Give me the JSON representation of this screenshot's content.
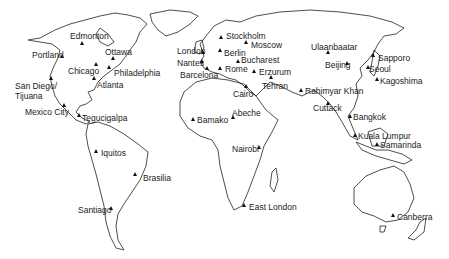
{
  "map": {
    "type": "world-outline",
    "marker_symbol": "triangle",
    "colors": {
      "land_outline": "#222222",
      "marker": "#111111",
      "label": "#222222",
      "background": "#ffffff"
    }
  },
  "cities": [
    {
      "name": "Edmonton",
      "mx": 82,
      "my": 43,
      "lx": 70,
      "ly": 32
    },
    {
      "name": "Portland",
      "mx": 62,
      "my": 56,
      "lx": 32,
      "ly": 51
    },
    {
      "name": "Ottawa",
      "mx": 113,
      "my": 58,
      "lx": 105,
      "ly": 48
    },
    {
      "name": "Chicago",
      "mx": 96,
      "my": 64,
      "lx": 68,
      "ly": 67
    },
    {
      "name": "Philadelphia",
      "mx": 109,
      "my": 67,
      "lx": 114,
      "ly": 69
    },
    {
      "name": "Atlanta",
      "mx": 94,
      "my": 78,
      "lx": 97,
      "ly": 81
    },
    {
      "name": "San Diego/",
      "mx": 51,
      "my": 78,
      "lx": 15,
      "ly": 82
    },
    {
      "name": "Tijuana",
      "mx": -100,
      "my": -100,
      "lx": 15,
      "ly": 92
    },
    {
      "name": "Mexico City",
      "mx": 64,
      "my": 105,
      "lx": 25,
      "ly": 108
    },
    {
      "name": "Tegucigalpa",
      "mx": 79,
      "my": 115,
      "lx": 82,
      "ly": 114
    },
    {
      "name": "Iquitos",
      "mx": 96,
      "my": 151,
      "lx": 101,
      "ly": 149
    },
    {
      "name": "Brasilia",
      "mx": 135,
      "my": 174,
      "lx": 143,
      "ly": 174
    },
    {
      "name": "Santiago",
      "mx": 111,
      "my": 208,
      "lx": 78,
      "ly": 206
    },
    {
      "name": "Stockholm",
      "mx": 221,
      "my": 37,
      "lx": 226,
      "ly": 32
    },
    {
      "name": "Moscow",
      "mx": 246,
      "my": 42,
      "lx": 251,
      "ly": 41
    },
    {
      "name": "London",
      "mx": 203,
      "my": 52,
      "lx": 177,
      "ly": 47
    },
    {
      "name": "Berlin",
      "mx": 220,
      "my": 50,
      "lx": 224,
      "ly": 49
    },
    {
      "name": "Nantes",
      "mx": 202,
      "my": 61,
      "lx": 177,
      "ly": 59
    },
    {
      "name": "Bucharest",
      "mx": 238,
      "my": 61,
      "lx": 241,
      "ly": 56
    },
    {
      "name": "Barcelona",
      "mx": 207,
      "my": 68,
      "lx": 180,
      "ly": 71
    },
    {
      "name": "Rome",
      "mx": 220,
      "my": 68,
      "lx": 225,
      "ly": 65
    },
    {
      "name": "Erzurum",
      "mx": 254,
      "my": 71,
      "lx": 259,
      "ly": 68
    },
    {
      "name": "Tehran",
      "mx": 271,
      "my": 77,
      "lx": 262,
      "ly": 82
    },
    {
      "name": "Cairo",
      "mx": 246,
      "my": 86,
      "lx": 233,
      "ly": 90
    },
    {
      "name": "Abeche",
      "mx": 233,
      "my": 117,
      "lx": 232,
      "ly": 109
    },
    {
      "name": "Bamako",
      "mx": 193,
      "my": 119,
      "lx": 197,
      "ly": 116
    },
    {
      "name": "Nairobi",
      "mx": 259,
      "my": 147,
      "lx": 232,
      "ly": 145
    },
    {
      "name": "East London",
      "mx": 244,
      "my": 205,
      "lx": 249,
      "ly": 203
    },
    {
      "name": "Ulaanbaatar",
      "mx": 328,
      "my": 52,
      "lx": 311,
      "ly": 43
    },
    {
      "name": "Beijing",
      "mx": 347,
      "my": 63,
      "lx": 325,
      "ly": 61
    },
    {
      "name": "Sapporo",
      "mx": 373,
      "my": 55,
      "lx": 378,
      "ly": 54
    },
    {
      "name": "Seoul",
      "mx": 368,
      "my": 67,
      "lx": 369,
      "ly": 65
    },
    {
      "name": "Kagoshima",
      "mx": 377,
      "my": 79,
      "lx": 380,
      "ly": 77
    },
    {
      "name": "Rahimyar Khan",
      "mx": 301,
      "my": 90,
      "lx": 305,
      "ly": 87
    },
    {
      "name": "Cuttack",
      "mx": 328,
      "my": 103,
      "lx": 313,
      "ly": 104
    },
    {
      "name": "Bangkok",
      "mx": 350,
      "my": 116,
      "lx": 353,
      "ly": 113
    },
    {
      "name": "Kuala Lumpur",
      "mx": 355,
      "my": 135,
      "lx": 358,
      "ly": 132
    },
    {
      "name": "Samarinda",
      "mx": 377,
      "my": 144,
      "lx": 380,
      "ly": 141
    },
    {
      "name": "Canberra",
      "mx": 393,
      "my": 215,
      "lx": 397,
      "ly": 213
    }
  ]
}
